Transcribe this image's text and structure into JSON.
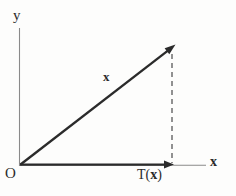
{
  "figure": {
    "type": "vector-diagram",
    "width": 236,
    "height": 196,
    "background_color": "#fdfdfc",
    "ink_color": "#2b2b2b",
    "axis_color": "#8a8a8a",
    "axes": {
      "y_axis": {
        "label": "y",
        "orientation": "vertical",
        "x": 19,
        "y_start": 28,
        "y_end": 165
      },
      "x_axis": {
        "label": "x",
        "orientation": "horizontal",
        "y": 165,
        "x_start": 19,
        "x_end": 206
      }
    },
    "origin": {
      "label": "O",
      "x": 19,
      "y": 165
    },
    "vectors": [
      {
        "name": "x",
        "label": "x",
        "label_style": "bold",
        "from": [
          20,
          165
        ],
        "to": [
          174,
          46
        ],
        "style": "solid-thick-arrow"
      },
      {
        "name": "T(x)",
        "label": "T(x)",
        "label_prefix": "T(",
        "label_bold": "x",
        "label_suffix": ")",
        "from": [
          20,
          165
        ],
        "to": [
          172,
          165
        ],
        "style": "solid-thick-arrow"
      }
    ],
    "guides": [
      {
        "name": "projection-guide",
        "style": "dashed",
        "from": [
          172,
          55
        ],
        "to": [
          172,
          163
        ]
      }
    ]
  }
}
